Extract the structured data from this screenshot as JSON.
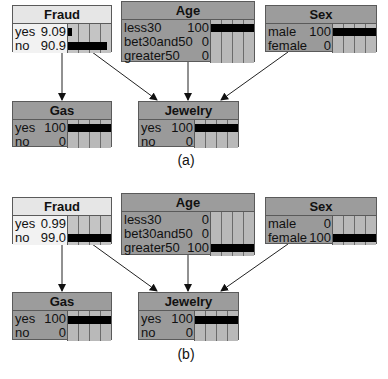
{
  "panels": [
    {
      "caption": "(a)",
      "nodes": {
        "fraud": {
          "title": "Fraud",
          "states": [
            {
              "label": "yes",
              "value": "9.09",
              "pct": 9.09
            },
            {
              "label": "no",
              "value": "90.9",
              "pct": 90.9
            }
          ]
        },
        "age": {
          "title": "Age",
          "states": [
            {
              "label": "less30",
              "value": "100",
              "pct": 100
            },
            {
              "label": "bet30and50",
              "value": "0",
              "pct": 0
            },
            {
              "label": "greater50",
              "value": "0",
              "pct": 0
            }
          ]
        },
        "sex": {
          "title": "Sex",
          "states": [
            {
              "label": "male",
              "value": "100",
              "pct": 100
            },
            {
              "label": "female",
              "value": "0",
              "pct": 0
            }
          ]
        },
        "gas": {
          "title": "Gas",
          "states": [
            {
              "label": "yes",
              "value": "100",
              "pct": 100
            },
            {
              "label": "no",
              "value": "0",
              "pct": 0
            }
          ]
        },
        "jewelry": {
          "title": "Jewelry",
          "states": [
            {
              "label": "yes",
              "value": "100",
              "pct": 100
            },
            {
              "label": "no",
              "value": "0",
              "pct": 0
            }
          ]
        }
      }
    },
    {
      "caption": "(b)",
      "nodes": {
        "fraud": {
          "title": "Fraud",
          "states": [
            {
              "label": "yes",
              "value": "0.99",
              "pct": 0.99
            },
            {
              "label": "no",
              "value": "99.0",
              "pct": 99.0
            }
          ]
        },
        "age": {
          "title": "Age",
          "states": [
            {
              "label": "less30",
              "value": "0",
              "pct": 0
            },
            {
              "label": "bet30and50",
              "value": "0",
              "pct": 0
            },
            {
              "label": "greater50",
              "value": "100",
              "pct": 100
            }
          ]
        },
        "sex": {
          "title": "Sex",
          "states": [
            {
              "label": "male",
              "value": "0",
              "pct": 0
            },
            {
              "label": "female",
              "value": "100",
              "pct": 100
            }
          ]
        },
        "gas": {
          "title": "Gas",
          "states": [
            {
              "label": "yes",
              "value": "100",
              "pct": 100
            },
            {
              "label": "no",
              "value": "0",
              "pct": 0
            }
          ]
        },
        "jewelry": {
          "title": "Jewelry",
          "states": [
            {
              "label": "yes",
              "value": "100",
              "pct": 100
            },
            {
              "label": "no",
              "value": "0",
              "pct": 0
            }
          ]
        }
      }
    }
  ],
  "edges": [
    {
      "from": "fraud",
      "to": "gas"
    },
    {
      "from": "fraud",
      "to": "jewelry"
    },
    {
      "from": "age",
      "to": "jewelry"
    },
    {
      "from": "sex",
      "to": "jewelry"
    }
  ]
}
